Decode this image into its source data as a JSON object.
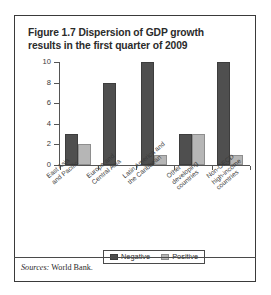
{
  "figure": {
    "number": "Figure 1.7",
    "title_line1": "Figure 1.7  Dispersion of GDP growth",
    "title_line2": "results in the first quarter of 2009",
    "source_lead": "Sources:",
    "source_text": " World Bank."
  },
  "legend": {
    "negative_label": "Negative",
    "positive_label": "Positive"
  },
  "colors": {
    "negative": "#4f4f4f",
    "positive": "#b6b6b6",
    "frame": "#3a3a3a",
    "axis": "#555555",
    "text": "#2b2b2b",
    "background": "#ffffff"
  },
  "chart_data": {
    "type": "bar",
    "title": "Figure 1.7  Dispersion of GDP growth results in the first quarter of 2009",
    "xlabel": "",
    "ylabel": "",
    "ylim": [
      0,
      10
    ],
    "yticks": [
      0,
      2,
      4,
      6,
      8,
      10
    ],
    "ytick_labels": [
      "0",
      "2",
      "4",
      "6",
      "8",
      "10"
    ],
    "grid": false,
    "legend_position": "bottom-center",
    "categories": [
      "East Asia and Pacific",
      "Europe and Central Asia",
      "Latin America and the Caribbean",
      "Other developing countries",
      "Non-OECD high-income countries"
    ],
    "category_lines": [
      [
        "East Asia",
        "and Pacific"
      ],
      [
        "Europe and",
        "Central Asia"
      ],
      [
        "Latin America and",
        "the Caribbean"
      ],
      [
        "Other",
        "developing",
        "countries"
      ],
      [
        "Non-OECD",
        "high-income",
        "countries"
      ]
    ],
    "series": [
      {
        "name": "Negative",
        "color": "#4f4f4f",
        "values": [
          3,
          8,
          10,
          3,
          10
        ]
      },
      {
        "name": "Positive",
        "color": "#b6b6b6",
        "values": [
          2,
          0,
          1,
          3,
          1
        ]
      }
    ],
    "source": "Sources: World Bank."
  }
}
